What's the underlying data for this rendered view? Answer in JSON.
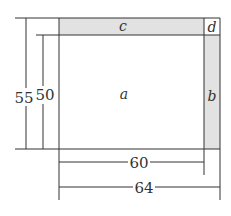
{
  "diagram": {
    "regions": {
      "a": "a",
      "b": "b",
      "c": "c",
      "d": "d"
    },
    "dimensions": {
      "outer_height": "55",
      "inner_height": "50",
      "inner_width": "60",
      "outer_width": "64"
    },
    "colors": {
      "line": "#333333",
      "shaded": "#e2e2e2",
      "background": "#ffffff"
    }
  }
}
